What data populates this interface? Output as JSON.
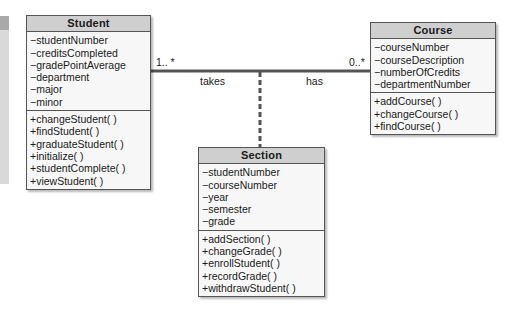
{
  "diagram": {
    "type": "UML class diagram",
    "classes": {
      "student": {
        "name": "Student",
        "attributes": [
          "−studentNumber",
          "−creditsCompleted",
          "−gradePointAverage",
          "−department",
          "−major",
          "−minor"
        ],
        "methods": [
          "+changeStudent( )",
          "+findStudent( )",
          "+graduateStudent( )",
          "+initialize( )",
          "+studentComplete( )",
          "+viewStudent( )"
        ]
      },
      "course": {
        "name": "Course",
        "attributes": [
          "−courseNumber",
          "−courseDescription",
          "−numberOfCredits",
          "−departmentNumber"
        ],
        "methods": [
          "+addCourse( )",
          "+changeCourse( )",
          "+findCourse( )"
        ]
      },
      "section": {
        "name": "Section",
        "attributes": [
          "−studentNumber",
          "−courseNumber",
          "−year",
          "−semester",
          "−grade"
        ],
        "methods": [
          "+addSection( )",
          "+changeGrade( )",
          "+enrollStudent( )",
          "+recordGrade( )",
          "+withdrawStudent( )"
        ]
      }
    },
    "association": {
      "multiplicity_student": "1.. *",
      "multiplicity_course": "0..*",
      "role_student": "takes",
      "role_course": "has"
    },
    "colors": {
      "header": "#cfcfcf",
      "body": "#f7f7f7",
      "line": "#555555"
    }
  }
}
